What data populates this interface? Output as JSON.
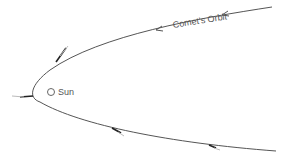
{
  "diagram": {
    "orbit_label": "Comet's Orbit",
    "sun_label": "Sun",
    "colors": {
      "orbit": "#555555",
      "text": "#555555",
      "background": "#ffffff"
    },
    "elements": [
      {
        "type": "orbit",
        "shape": "parabola",
        "opens": "right"
      },
      {
        "type": "sun",
        "symbol": "circle"
      },
      {
        "type": "direction-arrow",
        "count": 2,
        "position": "upper branch",
        "direction": "leftward"
      },
      {
        "type": "comet",
        "count": 4,
        "note": "comet positions with tails pointing away from the Sun"
      }
    ]
  }
}
